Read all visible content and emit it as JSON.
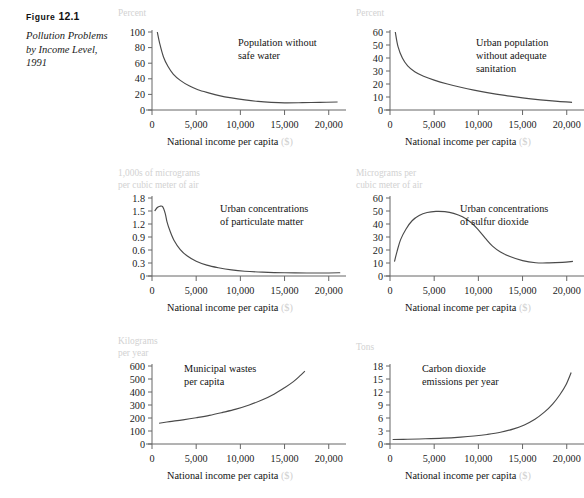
{
  "caption": {
    "figure_word": "Figure",
    "figure_number": "12.1",
    "title": "Pollution Problems by Income Level, 1991"
  },
  "common": {
    "xtitle": "National income per capita",
    "xtitle_unit": "($)",
    "xticks": [
      "0",
      "5,000",
      "10,000",
      "15,000",
      "20,000"
    ],
    "xtick_values": [
      0,
      5000,
      10000,
      15000,
      20000
    ],
    "axis_color": "#666666",
    "curve_color": "#4a4a4a",
    "ylabel_color": "#d2d2d2",
    "unit_color": "#cfcfcf"
  },
  "bottom_note": "",
  "chart_data": [
    {
      "id": "safe-water",
      "type": "line",
      "title": "Population without safe water",
      "ylabel": "Percent",
      "xlabel": "National income per capita ($)",
      "yticks": [
        0,
        20,
        40,
        60,
        80,
        100
      ],
      "ytick_labels": [
        "0",
        "20",
        "40",
        "60",
        "80",
        "100"
      ],
      "ylim": [
        0,
        100
      ],
      "xlim": [
        0,
        21500
      ],
      "x": [
        600,
        900,
        1300,
        1800,
        2400,
        3200,
        4200,
        5200,
        6400,
        7600,
        9000,
        10500,
        12000,
        13500,
        15000,
        17000,
        19000,
        21000
      ],
      "values": [
        100,
        84,
        68,
        56,
        46,
        38,
        31,
        26,
        22,
        18.5,
        15.5,
        13,
        11,
        9.8,
        9.2,
        9.4,
        9.8,
        10.2
      ]
    },
    {
      "id": "urban-sanitation",
      "type": "line",
      "title": "Urban population without adequate sanitation",
      "ylabel": "Percent",
      "xlabel": "National income per capita ($)",
      "yticks": [
        0,
        10,
        20,
        30,
        40,
        50,
        60
      ],
      "ytick_labels": [
        "0",
        "10",
        "20",
        "30",
        "40",
        "50",
        "60"
      ],
      "ylim": [
        0,
        60
      ],
      "xlim": [
        0,
        21500
      ],
      "x": [
        600,
        900,
        1400,
        2000,
        2800,
        3800,
        5000,
        6500,
        8000,
        9500,
        11000,
        13000,
        15000,
        17000,
        19000,
        20600
      ],
      "values": [
        60,
        49,
        40,
        34,
        29.5,
        26,
        23,
        20,
        17.5,
        15.3,
        13.4,
        11.2,
        9.3,
        7.8,
        6.6,
        5.9
      ]
    },
    {
      "id": "particulate-matter",
      "type": "line",
      "title": "Urban concentrations of particulate matter",
      "ylabel": "1,000s of micrograms per cubic meter of air",
      "xlabel": "National income per capita ($)",
      "yticks": [
        0,
        0.3,
        0.6,
        0.9,
        1.2,
        1.5,
        1.8
      ],
      "ytick_labels": [
        "0",
        "0.3",
        "0.6",
        "0.9",
        "1.2",
        "1.5",
        "1.8"
      ],
      "ylim": [
        0,
        1.8
      ],
      "xlim": [
        0,
        21500
      ],
      "x": [
        300,
        600,
        900,
        1200,
        1500,
        1700,
        2000,
        2500,
        3200,
        4000,
        5000,
        6200,
        7500,
        9000,
        10500,
        12500,
        15000,
        17500,
        20000,
        21300
      ],
      "values": [
        1.5,
        1.58,
        1.61,
        1.6,
        1.44,
        1.25,
        1.06,
        0.82,
        0.61,
        0.46,
        0.34,
        0.25,
        0.19,
        0.14,
        0.11,
        0.09,
        0.075,
        0.07,
        0.07,
        0.075
      ]
    },
    {
      "id": "sulfur-dioxide",
      "type": "line",
      "title": "Urban concentrations of sulfur dioxide",
      "ylabel": "Micrograms per cubic meter of air",
      "xlabel": "National income per capita ($)",
      "yticks": [
        0,
        10,
        20,
        30,
        40,
        50,
        60
      ],
      "ytick_labels": [
        "0",
        "10",
        "20",
        "30",
        "40",
        "50",
        "60"
      ],
      "ylim": [
        0,
        60
      ],
      "xlim": [
        0,
        21500
      ],
      "x": [
        500,
        800,
        1200,
        1800,
        2500,
        3300,
        4200,
        5200,
        6200,
        7200,
        8200,
        9200,
        10000,
        10800,
        11600,
        12500,
        13500,
        15000,
        16500,
        18000,
        19500,
        20700
      ],
      "values": [
        11,
        19,
        28,
        36,
        42.5,
        46.5,
        48.8,
        49.7,
        49.5,
        48.2,
        45.5,
        41,
        35.5,
        29,
        23,
        18.5,
        15.2,
        11.8,
        10.2,
        10.1,
        10.5,
        11.2
      ]
    },
    {
      "id": "municipal-wastes",
      "type": "line",
      "title": "Municipal wastes per capita",
      "ylabel": "Kilograms per year",
      "xlabel": "National income per capita ($)",
      "yticks": [
        0,
        100,
        200,
        300,
        400,
        500,
        600
      ],
      "ytick_labels": [
        "0",
        "100",
        "200",
        "300",
        "400",
        "500",
        "600"
      ],
      "ylim": [
        0,
        600
      ],
      "xlim": [
        0,
        21500
      ],
      "x": [
        800,
        2000,
        3500,
        5000,
        6500,
        8000,
        9500,
        11000,
        12500,
        13800,
        15000,
        16000,
        16800,
        17300
      ],
      "values": [
        160,
        172,
        186,
        202,
        220,
        243,
        268,
        300,
        340,
        383,
        433,
        480,
        528,
        560
      ]
    },
    {
      "id": "carbon-dioxide",
      "type": "line",
      "title": "Carbon dioxide emissions per year",
      "ylabel": "Tons",
      "xlabel": "National income per capita ($)",
      "yticks": [
        0,
        3,
        6,
        9,
        12,
        15,
        18
      ],
      "ytick_labels": [
        "0",
        "3",
        "6",
        "9",
        "12",
        "15",
        "18"
      ],
      "ylim": [
        0,
        18
      ],
      "xlim": [
        0,
        21500
      ],
      "x": [
        300,
        2000,
        4000,
        6000,
        8000,
        9500,
        11000,
        12500,
        14000,
        15200,
        16400,
        17500,
        18400,
        19200,
        19900,
        20500
      ],
      "values": [
        1.05,
        1.1,
        1.2,
        1.35,
        1.6,
        1.85,
        2.2,
        2.7,
        3.5,
        4.4,
        5.7,
        7.4,
        9.2,
        11.3,
        13.6,
        16.5
      ]
    }
  ],
  "annotations": {
    "safe-water": {
      "x": 126,
      "y": 22
    },
    "urban-sanitation": {
      "x": 126,
      "y": 22
    },
    "particulate-matter": {
      "x": 108,
      "y": 22
    },
    "sulfur-dioxide": {
      "x": 110,
      "y": 22
    },
    "municipal-wastes": {
      "x": 72,
      "y": 14
    },
    "carbon-dioxide": {
      "x": 72,
      "y": 14
    }
  }
}
